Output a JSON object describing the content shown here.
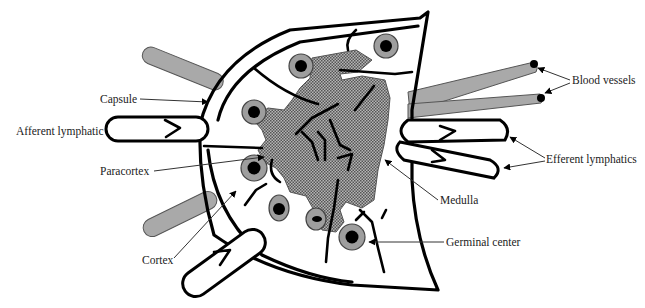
{
  "figure": {
    "type": "anatomical-diagram",
    "colors": {
      "background": "#ffffff",
      "outline": "#000000",
      "medulla_fill": "#8c8c8c",
      "vessel_fill": "#a9a9a9",
      "germinal_center_ring": "#9e9e9e",
      "label_text": "#222222"
    }
  },
  "labels": {
    "capsule": "Capsule",
    "afferent_lymphatic": "Afferent lymphatic",
    "paracortex": "Paracortex",
    "cortex": "Cortex",
    "blood_vessels": "Blood vessels",
    "efferent_lymphatics": "Efferent lymphatics",
    "medulla": "Medulla",
    "germinal_center": "Germinal center"
  }
}
